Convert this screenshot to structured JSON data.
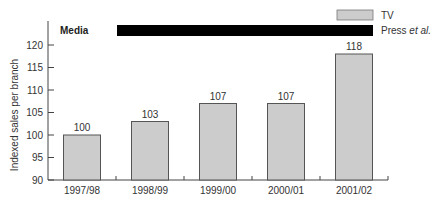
{
  "chart_data": {
    "type": "bar",
    "title": "",
    "xlabel": "",
    "ylabel": "Indexed sales per branch",
    "ylim": [
      90,
      124
    ],
    "yticks": [
      90,
      95,
      100,
      105,
      110,
      115,
      120
    ],
    "categories": [
      "1997/98",
      "1998/99",
      "1999/00",
      "2000/01",
      "2001/02"
    ],
    "series": [
      {
        "name": "TV",
        "values": [
          100,
          103,
          107,
          107,
          118
        ],
        "color": "#cccccc"
      }
    ],
    "data_labels": [
      "100",
      "103",
      "107",
      "107",
      "118"
    ],
    "annotations": [
      {
        "label": "Media",
        "type": "row-label"
      },
      {
        "label": "Press et al.",
        "type": "media-period-bar",
        "color": "#000000",
        "spans": [
          "1997/98",
          "2001/02"
        ]
      }
    ],
    "legend": {
      "position": "top-right",
      "entries": [
        {
          "label": "TV",
          "swatch": "#cccccc"
        },
        {
          "label": "Press et al.",
          "swatch": "#000000"
        }
      ]
    },
    "grid": false
  }
}
